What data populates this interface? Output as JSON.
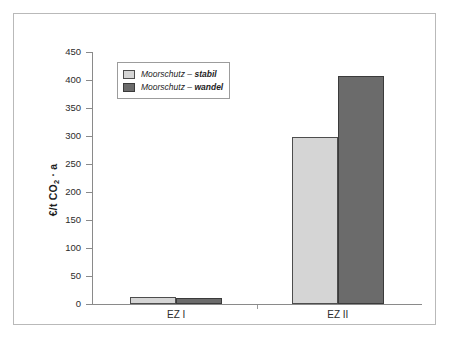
{
  "chart_data": {
    "type": "bar",
    "title": "",
    "subtitle": "",
    "xlabel": "",
    "ylabel": "€/t CO₂ · a",
    "ylabel_parts": {
      "prefix": "€/t CO",
      "sub": "2",
      "suffix": " · a"
    },
    "categories": [
      "EZ I",
      "EZ II"
    ],
    "series": [
      {
        "name": "Moorschutz – stabil",
        "name_plain": "Moorschutz –",
        "name_emph": "stabil",
        "color": "#d5d5d5",
        "values": [
          12,
          298
        ]
      },
      {
        "name": "Moorschutz – wandel",
        "name_plain": "Moorschutz –",
        "name_emph": "wandel",
        "color": "#6b6b6b",
        "values": [
          11,
          408
        ]
      }
    ],
    "ylim": [
      0,
      450
    ],
    "ytick_step": 50,
    "yticks": [
      450,
      400,
      350,
      300,
      250,
      200,
      150,
      100,
      50,
      0
    ],
    "ytick_labels": [
      "450",
      "400",
      "350",
      "300",
      "250",
      "200",
      "150",
      "100",
      "50",
      "0"
    ],
    "grid": false,
    "legend_position": "upper left"
  },
  "colors": {
    "series_light": "#d5d5d5",
    "series_dark": "#6b6b6b",
    "axis": "#8a8a8a",
    "frame": "#b9b9b9",
    "text": "#1d1d1d"
  }
}
